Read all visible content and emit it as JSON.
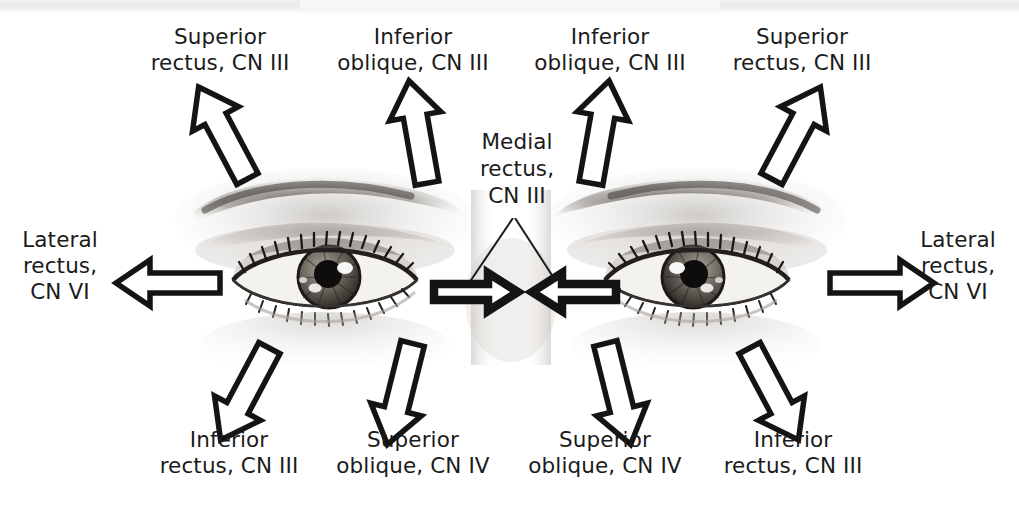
{
  "figure": {
    "background_color": "#ffffff",
    "text_color": "#1b1b1b",
    "arrow_outline_color": "#141414",
    "arrow_fill_color": "#ffffff"
  },
  "labels": {
    "top_far_left": "Superior\nrectus, CN III",
    "top_inner_left": "Inferior\noblique, CN III",
    "top_inner_right": "Inferior\noblique, CN III",
    "top_far_right": "Superior\nrectus, CN III",
    "center": "Medial\nrectus,\nCN III",
    "left_side": "Lateral\nrectus,\nCN VI",
    "right_side": "Lateral\nrectus,\nCN VI",
    "bottom_far_left": "Inferior\nrectus, CN III",
    "bottom_inner_left": "Superior\noblique, CN IV",
    "bottom_inner_right": "Superior\noblique, CN IV",
    "bottom_far_right": "Inferior\nrectus, CN III"
  },
  "arrows": [
    {
      "name": "arrow-superior-rectus-left",
      "direction": "up-left",
      "muscle": "Superior rectus",
      "nerve": "CN III"
    },
    {
      "name": "arrow-inferior-oblique-left",
      "direction": "up",
      "muscle": "Inferior oblique",
      "nerve": "CN III"
    },
    {
      "name": "arrow-inferior-oblique-right",
      "direction": "up",
      "muscle": "Inferior oblique",
      "nerve": "CN III"
    },
    {
      "name": "arrow-superior-rectus-right",
      "direction": "up-right",
      "muscle": "Superior rectus",
      "nerve": "CN III"
    },
    {
      "name": "arrow-lateral-rectus-left",
      "direction": "left",
      "muscle": "Lateral rectus",
      "nerve": "CN VI"
    },
    {
      "name": "arrow-lateral-rectus-right",
      "direction": "right",
      "muscle": "Lateral rectus",
      "nerve": "CN VI"
    },
    {
      "name": "arrow-medial-rectus-left",
      "direction": "right",
      "muscle": "Medial rectus",
      "nerve": "CN III"
    },
    {
      "name": "arrow-medial-rectus-right",
      "direction": "left",
      "muscle": "Medial rectus",
      "nerve": "CN III"
    },
    {
      "name": "arrow-inferior-rectus-left",
      "direction": "down-left",
      "muscle": "Inferior rectus",
      "nerve": "CN III"
    },
    {
      "name": "arrow-superior-oblique-left",
      "direction": "down",
      "muscle": "Superior oblique",
      "nerve": "CN IV"
    },
    {
      "name": "arrow-superior-oblique-right",
      "direction": "down",
      "muscle": "Superior oblique",
      "nerve": "CN IV"
    },
    {
      "name": "arrow-inferior-rectus-right",
      "direction": "down-right",
      "muscle": "Inferior rectus",
      "nerve": "CN III"
    }
  ]
}
